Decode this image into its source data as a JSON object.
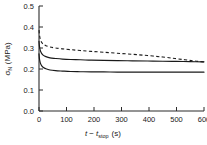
{
  "chart_data": {
    "type": "line",
    "title": "",
    "xlabel": "t - t_stop (s)",
    "xlabel_main": "t",
    "xlabel_minus": "−",
    "xlabel_t2": "t",
    "xlabel_sub": "stop",
    "xlabel_unit": "(s)",
    "ylabel": "σN (MPa)",
    "ylabel_sym": "σ",
    "ylabel_sub": "N",
    "ylabel_unit": "(MPa)",
    "xlim": [
      0,
      600
    ],
    "ylim": [
      0.0,
      0.5
    ],
    "xticks": [
      0,
      100,
      200,
      300,
      400,
      500,
      600
    ],
    "xtick_labels": [
      "0",
      "100",
      "200",
      "300",
      "400",
      "500",
      "600"
    ],
    "yticks": [
      0.0,
      0.1,
      0.2,
      0.3,
      0.4,
      0.5
    ],
    "ytick_labels": [
      "0.0",
      "0.1",
      "0.2",
      "0.3",
      "0.4",
      "0.5"
    ],
    "grid": false,
    "legend": "none",
    "axis_color": "#2b2b2b",
    "curve_color": "#1a1a1a",
    "series": [
      {
        "name": "upper-dashed",
        "style": "dashed",
        "x": [
          0,
          2,
          5,
          10,
          16,
          25,
          40,
          60,
          85,
          115,
          150,
          190,
          235,
          285,
          340,
          395,
          450,
          495,
          530,
          560,
          580,
          600
        ],
        "values": [
          0.385,
          0.36,
          0.341,
          0.326,
          0.318,
          0.311,
          0.305,
          0.3,
          0.296,
          0.292,
          0.288,
          0.284,
          0.28,
          0.275,
          0.27,
          0.264,
          0.257,
          0.25,
          0.244,
          0.239,
          0.236,
          0.234
        ]
      },
      {
        "name": "middle-solid",
        "style": "solid",
        "x": [
          0,
          2,
          5,
          10,
          16,
          25,
          40,
          60,
          85,
          115,
          150,
          190,
          235,
          285,
          340,
          395,
          450,
          500,
          550,
          600
        ],
        "values": [
          0.332,
          0.305,
          0.287,
          0.273,
          0.265,
          0.259,
          0.253,
          0.25,
          0.247,
          0.245,
          0.244,
          0.242,
          0.241,
          0.24,
          0.239,
          0.238,
          0.237,
          0.236,
          0.235,
          0.234
        ]
      },
      {
        "name": "lower-solid",
        "style": "solid",
        "x": [
          0,
          2,
          5,
          10,
          16,
          25,
          40,
          60,
          85,
          115,
          150,
          190,
          235,
          285,
          340,
          395,
          450,
          500,
          550,
          600
        ],
        "values": [
          0.272,
          0.246,
          0.228,
          0.215,
          0.207,
          0.201,
          0.195,
          0.192,
          0.19,
          0.188,
          0.187,
          0.186,
          0.186,
          0.185,
          0.185,
          0.185,
          0.185,
          0.185,
          0.185,
          0.185
        ]
      }
    ]
  }
}
